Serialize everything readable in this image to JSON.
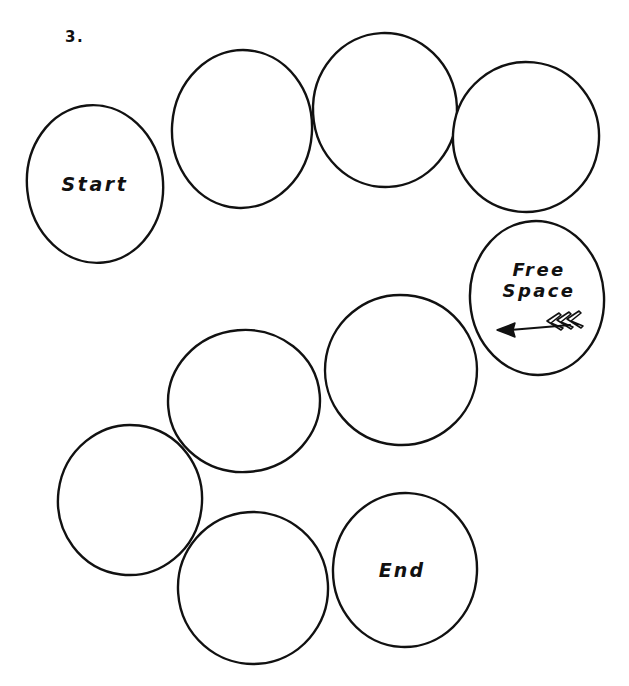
{
  "page": {
    "question_number": "3.",
    "background_color": "#ffffff",
    "stroke_color": "#111111",
    "text_color": "#111111",
    "width": 629,
    "height": 686
  },
  "board": {
    "title": "serpentine game board path",
    "cell_count": 9,
    "cells": [
      {
        "id": "cell-1",
        "label": "Start",
        "cx": 95,
        "cy": 184,
        "rx": 68,
        "ry": 79,
        "rotate": -6,
        "label_offset_y": 0
      },
      {
        "id": "cell-2",
        "label": "",
        "cx": 242,
        "cy": 129,
        "rx": 70,
        "ry": 79,
        "rotate": 4,
        "label_offset_y": 0
      },
      {
        "id": "cell-3",
        "label": "",
        "cx": 385,
        "cy": 110,
        "rx": 72,
        "ry": 77,
        "rotate": -3,
        "label_offset_y": 0
      },
      {
        "id": "cell-4",
        "label": "",
        "cx": 526,
        "cy": 137,
        "rx": 73,
        "ry": 75,
        "rotate": 6,
        "label_offset_y": 0
      },
      {
        "id": "cell-5",
        "label": "Free Space",
        "cx": 537,
        "cy": 298,
        "rx": 67,
        "ry": 77,
        "rotate": -4,
        "label_offset_y": -18
      },
      {
        "id": "cell-6",
        "label": "",
        "cx": 401,
        "cy": 370,
        "rx": 76,
        "ry": 75,
        "rotate": 5,
        "label_offset_y": 0
      },
      {
        "id": "cell-7",
        "label": "",
        "cx": 244,
        "cy": 401,
        "rx": 76,
        "ry": 71,
        "rotate": -5,
        "label_offset_y": 0
      },
      {
        "id": "cell-8",
        "label": "",
        "cx": 130,
        "cy": 500,
        "rx": 72,
        "ry": 75,
        "rotate": 7,
        "label_offset_y": 0
      },
      {
        "id": "cell-9",
        "label": "",
        "cx": 253,
        "cy": 588,
        "rx": 75,
        "ry": 76,
        "rotate": -4,
        "label_offset_y": 0
      },
      {
        "id": "cell-10",
        "label": "End",
        "cx": 405,
        "cy": 570,
        "rx": 72,
        "ry": 77,
        "rotate": 3,
        "label_offset_y": 0
      }
    ]
  },
  "free_space": {
    "line1": "Free",
    "line2": "Space",
    "arrow": {
      "name": "left-arrow-icon",
      "direction": "left",
      "description": "solid triangular arrowhead pointing left with three chevron fletchings on the right"
    }
  },
  "labels": {
    "start": "Start",
    "end": "End"
  }
}
